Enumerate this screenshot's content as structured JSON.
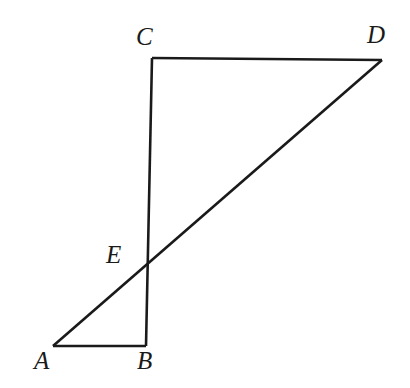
{
  "figure": {
    "background_color": "#ffffff",
    "stroke_color": "#1a1a1a",
    "stroke_width": 2.6,
    "width": 410,
    "height": 388,
    "points": [
      {
        "id": "A",
        "label": "A",
        "x": 53,
        "y": 346,
        "label_x": 34,
        "label_y": 348
      },
      {
        "id": "B",
        "label": "B",
        "x": 146,
        "y": 346,
        "label_x": 137,
        "label_y": 348
      },
      {
        "id": "C",
        "label": "C",
        "x": 152,
        "y": 58,
        "label_x": 136,
        "label_y": 24
      },
      {
        "id": "D",
        "label": "D",
        "x": 382,
        "y": 60,
        "label_x": 367,
        "label_y": 22
      },
      {
        "id": "E",
        "label": "E",
        "x": 146,
        "y": 266,
        "label_x": 106,
        "label_y": 242
      }
    ],
    "segments": [
      {
        "id": "AB",
        "from": "A",
        "to": "B",
        "x1": 53,
        "y1": 346,
        "x2": 146,
        "y2": 346
      },
      {
        "id": "BC",
        "from": "B",
        "to": "C",
        "x1": 146,
        "y1": 346,
        "x2": 152,
        "y2": 58
      },
      {
        "id": "CD",
        "from": "C",
        "to": "D",
        "x1": 152,
        "y1": 58,
        "x2": 382,
        "y2": 60
      },
      {
        "id": "AD",
        "from": "A",
        "to": "D",
        "x1": 53,
        "y1": 346,
        "x2": 382,
        "y2": 60
      }
    ],
    "intersection_note": "Segment AD crosses segment BC at point E"
  }
}
